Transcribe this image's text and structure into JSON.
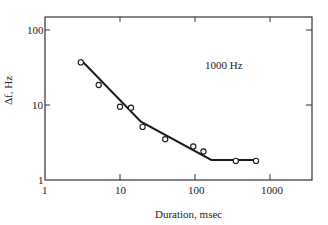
{
  "chart_data": {
    "type": "scatter",
    "title": "",
    "annotation": "1000 Hz",
    "xlabel": "Duration, msec",
    "ylabel": "Δf, Hz",
    "xscale": "log",
    "yscale": "log",
    "xlim": [
      1,
      3500
    ],
    "ylim": [
      1,
      150
    ],
    "x_ticks": [
      1,
      10,
      100,
      1000
    ],
    "x_tick_labels": [
      "1",
      "10",
      "100",
      "1000"
    ],
    "y_ticks": [
      1,
      10,
      100
    ],
    "y_tick_labels": [
      "1",
      "10",
      "100"
    ],
    "grid": false,
    "legend": null,
    "series": [
      {
        "name": "measured",
        "marker": "open-circle",
        "x": [
          3,
          5.2,
          10,
          14,
          20,
          40,
          95,
          130,
          350,
          650
        ],
        "y": [
          37,
          18.5,
          9.5,
          9.2,
          5.1,
          3.5,
          2.8,
          2.4,
          1.8,
          1.8
        ]
      },
      {
        "name": "fit",
        "style": "solid-line",
        "x": [
          3,
          19,
          165,
          650
        ],
        "y": [
          40,
          6,
          1.85,
          1.85
        ]
      }
    ]
  },
  "labels": {
    "annotation": "1000 Hz",
    "xlabel": "Duration, msec",
    "ylabel": "Δf, Hz",
    "x_ticks": [
      "1",
      "10",
      "100",
      "1000"
    ],
    "y_ticks": [
      "1",
      "10",
      "100"
    ]
  }
}
